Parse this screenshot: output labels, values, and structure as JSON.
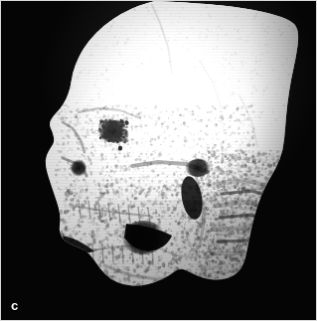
{
  "figure": {
    "panel_label": "c",
    "modality": "3D volume-rendered CT reconstruction",
    "view": "lateral (profile) view of human skull",
    "background_color": "#050505",
    "bone_color": "#ffffff",
    "border_color": "#d9d9d9",
    "label_color": "#f2f2f2",
    "width_px": 317,
    "height_px": 321
  },
  "anatomy": {
    "regions": [
      {
        "name": "calvaria-frontal-bone",
        "label": "Frontal bone / forehead"
      },
      {
        "name": "parietal-bone",
        "label": "Parietal bone"
      },
      {
        "name": "orbit",
        "label": "Orbital rim / eye socket"
      },
      {
        "name": "nasal-bone",
        "label": "Nasal bone"
      },
      {
        "name": "zygomatic-arch",
        "label": "Zygomatic arch"
      },
      {
        "name": "maxilla",
        "label": "Maxilla with upper dentition"
      },
      {
        "name": "mandible-ramus",
        "label": "Mandibular ramus"
      },
      {
        "name": "mandible-body",
        "label": "Mandibular body with lower dentition"
      },
      {
        "name": "cervical-spine",
        "label": "Cervical vertebrae C1-C4"
      }
    ]
  },
  "chart_data": {
    "type": "heatmap",
    "title": "",
    "xlabel": "",
    "ylabel": "",
    "colormap": "grayscale",
    "legend_position": "none",
    "grid": false,
    "annotations": [
      {
        "text": "c",
        "x": 12,
        "y": 305
      }
    ],
    "skull_outline": [
      [
        155,
        0
      ],
      [
        200,
        2
      ],
      [
        245,
        7
      ],
      [
        278,
        14
      ],
      [
        296,
        22
      ],
      [
        300,
        34
      ],
      [
        297,
        56
      ],
      [
        292,
        78
      ],
      [
        288,
        104
      ],
      [
        286,
        128
      ],
      [
        284,
        150
      ],
      [
        277,
        168
      ],
      [
        266,
        186
      ],
      [
        258,
        206
      ],
      [
        252,
        228
      ],
      [
        248,
        250
      ],
      [
        244,
        266
      ],
      [
        236,
        276
      ],
      [
        222,
        281
      ],
      [
        206,
        280
      ],
      [
        192,
        274
      ],
      [
        180,
        268
      ],
      [
        170,
        276
      ],
      [
        156,
        283
      ],
      [
        140,
        287
      ],
      [
        124,
        286
      ],
      [
        110,
        280
      ],
      [
        100,
        270
      ],
      [
        92,
        258
      ],
      [
        84,
        250
      ],
      [
        72,
        246
      ],
      [
        62,
        240
      ],
      [
        58,
        230
      ],
      [
        60,
        220
      ],
      [
        58,
        208
      ],
      [
        54,
        196
      ],
      [
        50,
        184
      ],
      [
        46,
        172
      ],
      [
        44,
        160
      ],
      [
        48,
        150
      ],
      [
        54,
        142
      ],
      [
        52,
        132
      ],
      [
        48,
        124
      ],
      [
        52,
        116
      ],
      [
        60,
        108
      ],
      [
        66,
        98
      ],
      [
        70,
        86
      ],
      [
        72,
        72
      ],
      [
        78,
        56
      ],
      [
        88,
        40
      ],
      [
        104,
        24
      ],
      [
        122,
        12
      ],
      [
        140,
        4
      ],
      [
        155,
        0
      ]
    ],
    "dark_features": [
      {
        "name": "orbit-socket",
        "cx": 112,
        "cy": 131,
        "rx": 14,
        "ry": 11
      },
      {
        "name": "oral-cavity-gap",
        "cx": 143,
        "cy": 238,
        "rx": 22,
        "ry": 17
      },
      {
        "name": "sub-zygomatic-shadow",
        "cx": 198,
        "cy": 168,
        "rx": 13,
        "ry": 9
      },
      {
        "name": "nasal-aperture",
        "cx": 78,
        "cy": 168,
        "rx": 8,
        "ry": 9
      }
    ]
  }
}
